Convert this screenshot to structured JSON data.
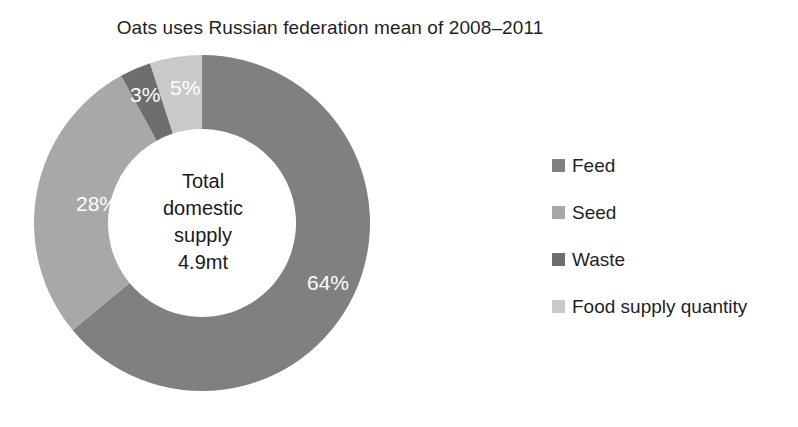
{
  "chart_data": {
    "type": "pie",
    "variant": "donut",
    "title": "Oats uses Russian federation mean of 2008–2011",
    "categories": [
      "Feed",
      "Seed",
      "Waste",
      "Food supply quantity"
    ],
    "values": [
      64,
      28,
      3,
      5
    ],
    "value_labels": [
      "64%",
      "28%",
      "3%",
      "5%"
    ],
    "unit": "percent",
    "colors": [
      "#808080",
      "#a8a8a8",
      "#6e6e6e",
      "#c9c9c9"
    ],
    "start_angle_deg": 0,
    "direction": "clockwise",
    "inner_radius_ratio": 0.56,
    "legend_position": "right",
    "grid": false,
    "xlabel": "",
    "ylabel": "",
    "center_annotation": {
      "lines": [
        "Total",
        "domestic",
        "supply",
        "4.9mt"
      ],
      "total_value": "4.9mt",
      "total_label": "Total domestic supply"
    }
  },
  "legend": {
    "items": [
      {
        "label": "Feed",
        "color": "#808080"
      },
      {
        "label": "Seed",
        "color": "#a8a8a8"
      },
      {
        "label": "Waste",
        "color": "#6e6e6e"
      },
      {
        "label": "Food supply quantity",
        "color": "#c9c9c9"
      }
    ]
  },
  "slices": [
    {
      "name": "Feed",
      "label": "64%",
      "label_x": 289,
      "label_y": 243,
      "color": "#808080"
    },
    {
      "name": "Seed",
      "label": "28%",
      "label_x": 58,
      "label_y": 164,
      "color": "#a8a8a8"
    },
    {
      "name": "Waste",
      "label": "3%",
      "label_x": 112,
      "label_y": 55,
      "color": "#6e6e6e"
    },
    {
      "name": "Food supply quantity",
      "label": "5%",
      "label_x": 152,
      "label_y": 48,
      "color": "#c9c9c9"
    }
  ],
  "geometry": {
    "cx": 184,
    "cy": 176,
    "outer_r": 168,
    "inner_r": 94
  }
}
